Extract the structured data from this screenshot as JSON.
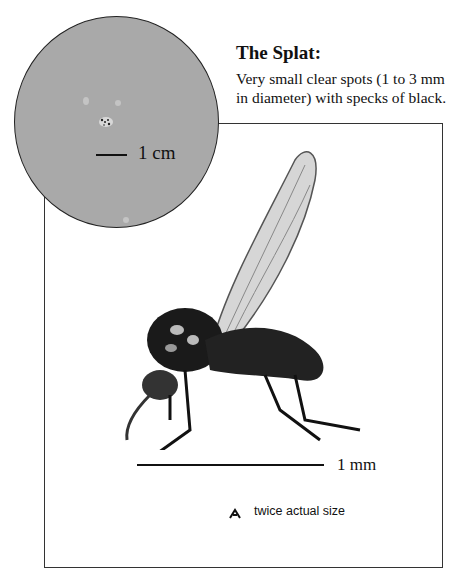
{
  "splat": {
    "title": "The Splat:",
    "description_line1": "Very small clear spots (1 to 3 mm",
    "description_line2": "in diameter) with specks of black."
  },
  "circle_inset": {
    "scale_label": "1 cm",
    "background_color": "#a9a9a9"
  },
  "illustration": {
    "subject": "fly",
    "scale_label": "1 mm",
    "actual_size_label": "twice actual size"
  }
}
